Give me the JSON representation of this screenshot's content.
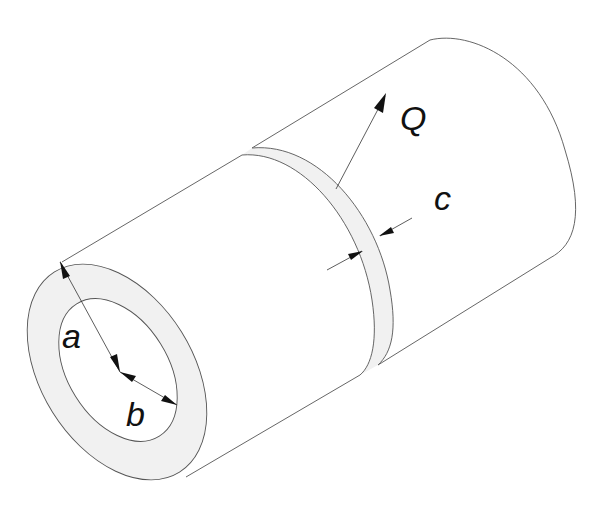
{
  "diagram": {
    "type": "isometric hollow cylinder with annular band",
    "labels": {
      "a": "a",
      "b": "b",
      "c": "c",
      "Q": "Q"
    },
    "colors": {
      "background": "#ffffff",
      "line": "#555555",
      "ring_fill": "#f1f1f1",
      "text": "#111111"
    },
    "parts": [
      "front-annular-face",
      "inner-bore",
      "cylinder-body",
      "heat-band",
      "back-end"
    ],
    "dimensions": [
      {
        "label": "a",
        "meaning": "outer radius",
        "from": "center",
        "to": "outer edge"
      },
      {
        "label": "b",
        "meaning": "inner radius",
        "from": "center",
        "to": "inner edge"
      },
      {
        "label": "c",
        "meaning": "band width"
      },
      {
        "label": "Q",
        "meaning": "heat flow arrow from band surface"
      }
    ]
  }
}
